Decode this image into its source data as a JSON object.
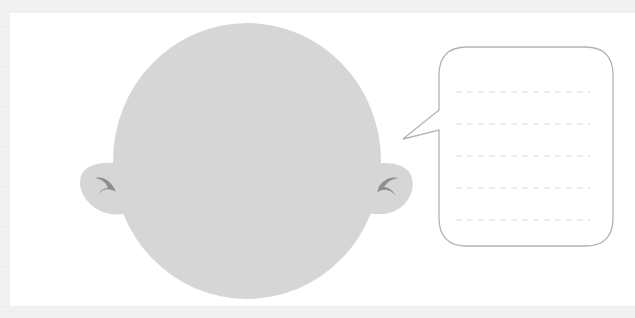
{
  "worksheet": {
    "colors": {
      "background": "#efefef",
      "card": "#ffffff",
      "head_fill": "#d6d6d6",
      "ear_inner": "#8e8e8e",
      "bubble_stroke": "#b4b4b4",
      "line_dash": "#dcdcdc"
    },
    "head": {
      "cx": 247,
      "cy": 161,
      "rx": 134,
      "ry": 138
    },
    "speech_bubble": {
      "x": 439,
      "y": 47,
      "width": 174,
      "height": 199,
      "radius": 28,
      "writing_lines": 5
    }
  }
}
